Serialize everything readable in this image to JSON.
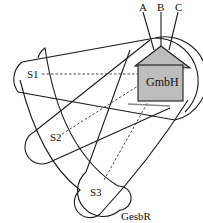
{
  "diagram": {
    "top_labels": [
      "A",
      "B",
      "C"
    ],
    "center_node": "GmbH",
    "nodes": [
      "S1",
      "S2",
      "S3"
    ],
    "bottom_label": "GesbR",
    "colors": {
      "house_fill": "#bdbdbd",
      "stroke": "#1a1a1a",
      "background": "#ffffff"
    }
  }
}
